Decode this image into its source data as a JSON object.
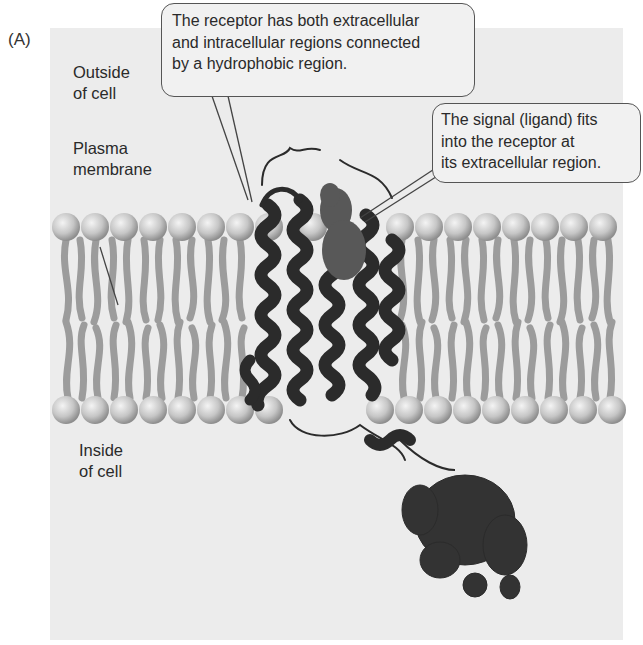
{
  "figure": {
    "panel_label": "(A)",
    "labels": {
      "outside": [
        "Outside",
        "of cell"
      ],
      "membrane": [
        "Plasma",
        "membrane"
      ],
      "inside": [
        "Inside",
        "of cell"
      ]
    },
    "callouts": [
      {
        "lines": [
          "The receptor has both extracellular",
          "and intracellular regions connected",
          "by a hydrophobic region."
        ]
      },
      {
        "lines": [
          "The signal (ligand) fits",
          "into the receptor at",
          "its extracellular region."
        ]
      }
    ],
    "colors": {
      "background_panel": "#ececec",
      "phospholipid_head": "#c8c8c8",
      "phospholipid_tail": "#9a9a9a",
      "receptor_protein": "#2b2b2b",
      "ligand": "#5a5a5a"
    },
    "membrane": {
      "outer_heads": 19,
      "inner_heads": 19
    }
  }
}
